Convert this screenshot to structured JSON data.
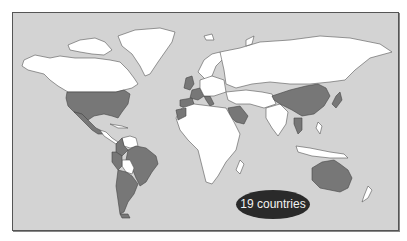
{
  "map": {
    "title": "",
    "projection": "world-equirectangular",
    "colors": {
      "ocean": "#d3d3d3",
      "land_unselected": "#ffffff",
      "land_selected": "#777777",
      "badge_background": "#2a2a2a",
      "badge_text": "#f2f2f2",
      "frame_border": "#555555"
    },
    "badge": {
      "label": "19 countries"
    },
    "highlighted_regions": [
      "United States",
      "Mexico",
      "Guatemala",
      "Colombia",
      "Ecuador",
      "Peru",
      "Brazil",
      "Paraguay",
      "Argentina",
      "Chile",
      "United Kingdom",
      "Netherlands",
      "France",
      "Spain",
      "Italy",
      "Morocco",
      "Saudi Arabia",
      "China",
      "Japan",
      "Thailand",
      "Australia"
    ],
    "highlighted_count": 19
  }
}
